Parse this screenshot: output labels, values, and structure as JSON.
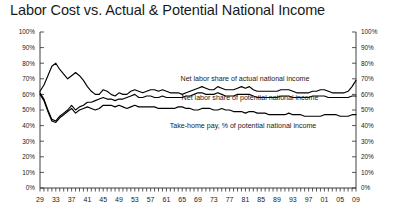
{
  "chart_data": {
    "type": "line",
    "title": "Labor Cost vs. Actual & Potential National Income",
    "xlabel": "",
    "ylabel": "",
    "ylim": [
      0,
      100
    ],
    "xlim": [
      1929,
      2009
    ],
    "grid": false,
    "legend_position": "inline-annotations",
    "y_ticks": [
      "0%",
      "10%",
      "20%",
      "30%",
      "40%",
      "50%",
      "60%",
      "70%",
      "80%",
      "90%",
      "100%"
    ],
    "y_tick_values": [
      0,
      10,
      20,
      30,
      40,
      50,
      60,
      70,
      80,
      90,
      100
    ],
    "right_axis_ticks": [
      "0%",
      "10%",
      "20%",
      "30%",
      "40%",
      "50%",
      "60%",
      "70%",
      "80%",
      "90%",
      "100%"
    ],
    "x_tick_labels": [
      "29",
      "33",
      "37",
      "41",
      "45",
      "49",
      "53",
      "57",
      "61",
      "65",
      "69",
      "73",
      "77",
      "81",
      "85",
      "89",
      "93",
      "97",
      "01",
      "05",
      "09"
    ],
    "x_tick_values": [
      1929,
      1933,
      1937,
      1941,
      1945,
      1949,
      1953,
      1957,
      1961,
      1965,
      1969,
      1973,
      1977,
      1981,
      1985,
      1989,
      1993,
      1997,
      2001,
      2005,
      2009
    ],
    "x_minor_tick_interval": 1,
    "series": [
      {
        "name": "Net labor share of actual national income",
        "annotation": "Net labor share of actual national income",
        "color": "#000000",
        "x": [
          1929,
          1930,
          1931,
          1932,
          1933,
          1934,
          1935,
          1936,
          1937,
          1938,
          1939,
          1940,
          1941,
          1942,
          1943,
          1944,
          1945,
          1946,
          1947,
          1948,
          1949,
          1950,
          1951,
          1952,
          1953,
          1954,
          1955,
          1956,
          1957,
          1958,
          1959,
          1960,
          1961,
          1962,
          1963,
          1964,
          1965,
          1966,
          1967,
          1968,
          1969,
          1970,
          1971,
          1972,
          1973,
          1974,
          1975,
          1976,
          1977,
          1978,
          1979,
          1980,
          1981,
          1982,
          1983,
          1984,
          1985,
          1986,
          1987,
          1988,
          1989,
          1990,
          1991,
          1992,
          1993,
          1994,
          1995,
          1996,
          1997,
          1998,
          1999,
          2000,
          2001,
          2002,
          2003,
          2004,
          2005,
          2006,
          2007,
          2008,
          2009
        ],
        "values": [
          62,
          66,
          72,
          78,
          80,
          76,
          73,
          70,
          72,
          74,
          72,
          69,
          65,
          62,
          60,
          60,
          63,
          62,
          60,
          59,
          61,
          60,
          60,
          62,
          63,
          62,
          61,
          62,
          63,
          63,
          62,
          63,
          62,
          61,
          61,
          61,
          60,
          61,
          62,
          63,
          64,
          65,
          64,
          63,
          63,
          65,
          64,
          63,
          63,
          63,
          64,
          65,
          64,
          65,
          63,
          62,
          62,
          62,
          62,
          62,
          62,
          63,
          63,
          63,
          62,
          61,
          61,
          61,
          61,
          62,
          62,
          63,
          63,
          62,
          61,
          61,
          61,
          61,
          62,
          65,
          69
        ]
      },
      {
        "name": "Net labor share of potential national income",
        "annotation": "Net labor share of potential national income",
        "color": "#000000",
        "x": [
          1929,
          1930,
          1931,
          1932,
          1933,
          1934,
          1935,
          1936,
          1937,
          1938,
          1939,
          1940,
          1941,
          1942,
          1943,
          1944,
          1945,
          1946,
          1947,
          1948,
          1949,
          1950,
          1951,
          1952,
          1953,
          1954,
          1955,
          1956,
          1957,
          1958,
          1959,
          1960,
          1961,
          1962,
          1963,
          1964,
          1965,
          1966,
          1967,
          1968,
          1969,
          1970,
          1971,
          1972,
          1973,
          1974,
          1975,
          1976,
          1977,
          1978,
          1979,
          1980,
          1981,
          1982,
          1983,
          1984,
          1985,
          1986,
          1987,
          1988,
          1989,
          1990,
          1991,
          1992,
          1993,
          1994,
          1995,
          1996,
          1997,
          1998,
          1999,
          2000,
          2001,
          2002,
          2003,
          2004,
          2005,
          2006,
          2007,
          2008,
          2009
        ],
        "values": [
          61,
          57,
          50,
          44,
          43,
          46,
          48,
          50,
          53,
          50,
          52,
          53,
          55,
          55,
          56,
          57,
          58,
          57,
          57,
          56,
          57,
          57,
          58,
          59,
          60,
          58,
          58,
          59,
          59,
          58,
          58,
          59,
          58,
          58,
          58,
          58,
          58,
          59,
          59,
          60,
          61,
          61,
          60,
          60,
          60,
          61,
          60,
          59,
          59,
          59,
          60,
          60,
          60,
          60,
          59,
          58,
          58,
          58,
          58,
          58,
          58,
          59,
          59,
          59,
          58,
          58,
          58,
          58,
          58,
          59,
          59,
          59,
          59,
          58,
          58,
          58,
          58,
          58,
          58,
          59,
          59
        ]
      },
      {
        "name": "Take-home pay, % of potential national income",
        "annotation": "Take-home pay, % of potential national income",
        "color": "#000000",
        "x": [
          1929,
          1930,
          1931,
          1932,
          1933,
          1934,
          1935,
          1936,
          1937,
          1938,
          1939,
          1940,
          1941,
          1942,
          1943,
          1944,
          1945,
          1946,
          1947,
          1948,
          1949,
          1950,
          1951,
          1952,
          1953,
          1954,
          1955,
          1956,
          1957,
          1958,
          1959,
          1960,
          1961,
          1962,
          1963,
          1964,
          1965,
          1966,
          1967,
          1968,
          1969,
          1970,
          1971,
          1972,
          1973,
          1974,
          1975,
          1976,
          1977,
          1978,
          1979,
          1980,
          1981,
          1982,
          1983,
          1984,
          1985,
          1986,
          1987,
          1988,
          1989,
          1990,
          1991,
          1992,
          1993,
          1994,
          1995,
          1996,
          1997,
          1998,
          1999,
          2000,
          2001,
          2002,
          2003,
          2004,
          2005,
          2006,
          2007,
          2008,
          2009
        ],
        "values": [
          60,
          56,
          49,
          43,
          42,
          45,
          47,
          49,
          51,
          48,
          50,
          51,
          52,
          51,
          50,
          51,
          53,
          53,
          53,
          52,
          53,
          52,
          51,
          52,
          53,
          52,
          52,
          52,
          52,
          52,
          51,
          51,
          51,
          51,
          51,
          52,
          52,
          51,
          51,
          50,
          50,
          51,
          51,
          51,
          50,
          50,
          51,
          50,
          50,
          49,
          49,
          49,
          48,
          49,
          49,
          48,
          48,
          48,
          47,
          47,
          47,
          47,
          47,
          48,
          47,
          47,
          47,
          46,
          46,
          46,
          46,
          46,
          47,
          47,
          47,
          47,
          46,
          46,
          46,
          47,
          47
        ]
      }
    ]
  }
}
